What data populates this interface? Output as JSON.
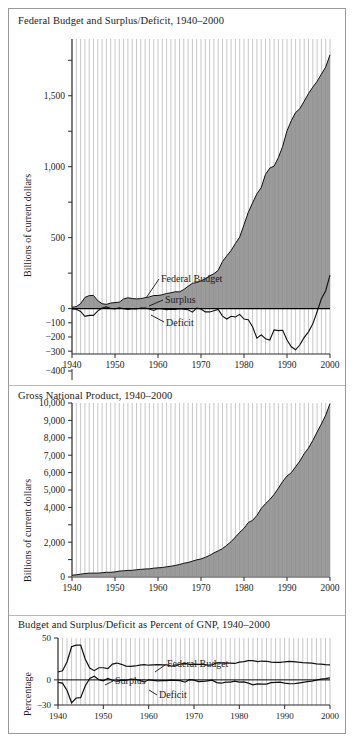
{
  "figure": {
    "ylabel_currency": "Billions of current dollars",
    "ylabel_percentage": "Percentage",
    "annotations": {
      "federal_budget": "Federal Budget",
      "surplus": "Surplus",
      "deficit": "Deficit"
    }
  },
  "chart_data": [
    {
      "type": "area",
      "title": "Federal Budget and Surplus/Deficit, 1940–2000",
      "xlabel": "",
      "ylabel": "Billions of current dollars",
      "grid": true,
      "legend_position": "inline-annotations",
      "xlim": [
        1940,
        2000
      ],
      "ylim": [
        -400,
        1900
      ],
      "xticks": [
        1940,
        1950,
        1960,
        1970,
        1980,
        1990,
        2000
      ],
      "xtick_labels": [
        "1940",
        "1950",
        "1960",
        "1970",
        "1980",
        "1990",
        "2000"
      ],
      "yticks": [
        -400,
        -300,
        -200,
        -100,
        0,
        500,
        1000,
        1500
      ],
      "ytick_labels": [
        "−400",
        "−300",
        "−200",
        "−100",
        "0",
        "500",
        "1,000",
        "1,500"
      ],
      "annotations": [
        "Federal Budget",
        "Surplus",
        "Deficit"
      ],
      "x": [
        1940,
        1941,
        1942,
        1943,
        1944,
        1945,
        1946,
        1947,
        1948,
        1949,
        1950,
        1951,
        1952,
        1953,
        1954,
        1955,
        1956,
        1957,
        1958,
        1959,
        1960,
        1961,
        1962,
        1963,
        1964,
        1965,
        1966,
        1967,
        1968,
        1969,
        1970,
        1971,
        1972,
        1973,
        1974,
        1975,
        1976,
        1977,
        1978,
        1979,
        1980,
        1981,
        1982,
        1983,
        1984,
        1985,
        1986,
        1987,
        1988,
        1989,
        1990,
        1991,
        1992,
        1993,
        1994,
        1995,
        1996,
        1997,
        1998,
        1999,
        2000
      ],
      "series": [
        {
          "name": "Federal Budget",
          "values": [
            9.5,
            13.7,
            35.1,
            78.6,
            91.3,
            92.7,
            55.2,
            34.5,
            29.8,
            38.8,
            42.6,
            45.5,
            67.7,
            76.1,
            70.9,
            68.4,
            70.6,
            76.6,
            82.4,
            92.1,
            92.2,
            97.7,
            106.8,
            111.3,
            118.5,
            118.2,
            134.5,
            157.5,
            178.1,
            183.6,
            195.6,
            210.2,
            230.7,
            245.7,
            269.4,
            332.3,
            371.8,
            409.2,
            458.7,
            504.0,
            590.9,
            678.2,
            745.7,
            808.4,
            851.8,
            946.4,
            990.3,
            1004.0,
            1064.4,
            1143.7,
            1253.0,
            1324.2,
            1381.5,
            1409.4,
            1461.8,
            1515.7,
            1560.5,
            1601.1,
            1652.5,
            1701.8,
            1788.8
          ]
        },
        {
          "name": "Surplus/Deficit",
          "values": [
            -2.9,
            -4.9,
            -20.5,
            -54.6,
            -47.6,
            -47.6,
            -15.9,
            4.0,
            11.8,
            0.6,
            -3.1,
            6.1,
            -1.5,
            -6.5,
            -1.2,
            -3.0,
            3.9,
            3.4,
            -2.8,
            -12.8,
            0.3,
            -3.3,
            -7.1,
            -4.8,
            -5.9,
            -1.4,
            -3.7,
            -8.6,
            -25.2,
            3.2,
            -2.8,
            -23.0,
            -23.4,
            -14.9,
            -6.1,
            -53.2,
            -73.7,
            -53.7,
            -59.2,
            -40.7,
            -73.8,
            -79.0,
            -128.0,
            -207.8,
            -185.4,
            -212.3,
            -221.2,
            -149.7,
            -155.2,
            -152.6,
            -221.0,
            -269.2,
            -290.3,
            -255.1,
            -203.2,
            -164.0,
            -107.4,
            -21.9,
            69.3,
            125.6,
            236.2
          ]
        }
      ]
    },
    {
      "type": "area",
      "title": "Gross National Product, 1940–2000",
      "xlabel": "",
      "ylabel": "Billions of current dollars",
      "grid": true,
      "legend_position": "none",
      "xlim": [
        1940,
        2000
      ],
      "ylim": [
        0,
        10000
      ],
      "xticks": [
        1940,
        1950,
        1960,
        1970,
        1980,
        1990,
        2000
      ],
      "xtick_labels": [
        "1940",
        "1950",
        "1960",
        "1970",
        "1980",
        "1990",
        "2000"
      ],
      "yticks": [
        0,
        1000,
        2000,
        3000,
        4000,
        5000,
        6000,
        7000,
        8000,
        9000,
        10000
      ],
      "ytick_labels": [
        "0",
        "",
        "2,000",
        "",
        "4,000",
        "5,000",
        "6,000",
        "7,000",
        "8,000",
        "9,000",
        "10,000"
      ],
      "x": [
        1940,
        1941,
        1942,
        1943,
        1944,
        1945,
        1946,
        1947,
        1948,
        1949,
        1950,
        1951,
        1952,
        1953,
        1954,
        1955,
        1956,
        1957,
        1958,
        1959,
        1960,
        1961,
        1962,
        1963,
        1964,
        1965,
        1966,
        1967,
        1968,
        1969,
        1970,
        1971,
        1972,
        1973,
        1974,
        1975,
        1976,
        1977,
        1978,
        1979,
        1980,
        1981,
        1982,
        1983,
        1984,
        1985,
        1986,
        1987,
        1988,
        1989,
        1990,
        1991,
        1992,
        1993,
        1994,
        1995,
        1996,
        1997,
        1998,
        1999,
        2000
      ],
      "series": [
        {
          "name": "Gross National Product",
          "values": [
            101,
            127,
            162,
            199,
            220,
            223,
            222,
            244,
            270,
            267,
            294,
            339,
            358,
            379,
            381,
            415,
            438,
            461,
            468,
            507,
            527,
            545,
            586,
            618,
            664,
            719,
            788,
            833,
            910,
            985,
            1039,
            1128,
            1241,
            1386,
            1501,
            1635,
            1824,
            2031,
            2295,
            2566,
            2796,
            3131,
            3259,
            3535,
            3933,
            4213,
            4453,
            4742,
            5108,
            5489,
            5803,
            5996,
            6338,
            6667,
            7085,
            7415,
            7839,
            8332,
            8794,
            9299,
            9963
          ]
        }
      ]
    },
    {
      "type": "line",
      "title": "Budget and Surplus/Deficit as Percent of GNP, 1940–2000",
      "xlabel": "",
      "ylabel": "Percentage",
      "grid": true,
      "legend_position": "inline-annotations",
      "xlim": [
        1940,
        2000
      ],
      "ylim": [
        -30,
        50
      ],
      "xticks": [
        1940,
        1950,
        1960,
        1970,
        1980,
        1990,
        2000
      ],
      "xtick_labels": [
        "1940",
        "1950",
        "1960",
        "1970",
        "1980",
        "1990",
        "2000"
      ],
      "yticks": [
        -30,
        0,
        50
      ],
      "ytick_labels": [
        "−30",
        "0",
        "50"
      ],
      "annotations": [
        "Federal Budget",
        "Surplus",
        "Deficit"
      ],
      "x": [
        1940,
        1941,
        1942,
        1943,
        1944,
        1945,
        1946,
        1947,
        1948,
        1949,
        1950,
        1951,
        1952,
        1953,
        1954,
        1955,
        1956,
        1957,
        1958,
        1959,
        1960,
        1961,
        1962,
        1963,
        1964,
        1965,
        1966,
        1967,
        1968,
        1969,
        1970,
        1971,
        1972,
        1973,
        1974,
        1975,
        1976,
        1977,
        1978,
        1979,
        1980,
        1981,
        1982,
        1983,
        1984,
        1985,
        1986,
        1987,
        1988,
        1989,
        1990,
        1991,
        1992,
        1993,
        1994,
        1995,
        1996,
        1997,
        1998,
        1999,
        2000
      ],
      "series": [
        {
          "name": "Federal Budget",
          "values": [
            9.4,
            10.8,
            21.7,
            39.5,
            41.5,
            41.6,
            24.9,
            14.1,
            11.0,
            14.5,
            14.5,
            13.4,
            18.9,
            20.1,
            18.6,
            16.5,
            16.1,
            16.6,
            17.6,
            18.2,
            17.5,
            17.9,
            18.2,
            18.0,
            17.8,
            16.4,
            17.1,
            18.9,
            19.6,
            18.6,
            18.8,
            18.6,
            18.6,
            17.7,
            17.9,
            20.3,
            20.4,
            20.1,
            20.0,
            19.6,
            21.1,
            21.7,
            22.9,
            22.9,
            21.7,
            22.5,
            22.2,
            21.2,
            20.8,
            20.8,
            21.6,
            22.1,
            21.8,
            21.1,
            20.6,
            20.4,
            19.9,
            19.2,
            18.8,
            18.3,
            18.0
          ],
          "annotation": "Federal Budget"
        },
        {
          "name": "Surplus/Deficit",
          "values": [
            -2.9,
            -3.9,
            -12.7,
            -27.4,
            -21.6,
            -21.3,
            -7.2,
            1.6,
            4.4,
            0.2,
            -1.1,
            1.8,
            -0.4,
            -1.7,
            -0.3,
            -0.7,
            0.9,
            0.7,
            -0.6,
            -2.5,
            0.1,
            -0.6,
            -1.2,
            -0.8,
            -0.9,
            -0.2,
            -0.5,
            -1.0,
            -2.8,
            0.3,
            -0.3,
            -2.0,
            -1.9,
            -1.1,
            -0.4,
            -3.3,
            -4.0,
            -2.6,
            -2.6,
            -1.6,
            -2.6,
            -2.5,
            -3.9,
            -5.9,
            -4.7,
            -5.0,
            -5.0,
            -3.2,
            -3.0,
            -2.8,
            -3.8,
            -4.5,
            -4.6,
            -3.8,
            -2.9,
            -2.2,
            -1.4,
            -0.3,
            0.8,
            1.4,
            2.4
          ],
          "annotation": "Deficit"
        }
      ]
    }
  ]
}
